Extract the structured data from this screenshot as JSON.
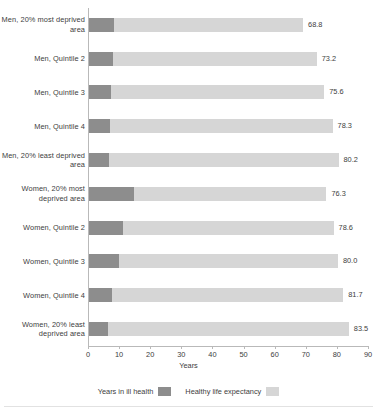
{
  "chart_data": {
    "type": "bar",
    "orientation": "horizontal",
    "stacked": true,
    "title": "",
    "xlabel": "Years",
    "ylabel": "",
    "xlim": [
      0,
      90
    ],
    "xticks": [
      0,
      10,
      20,
      30,
      40,
      50,
      60,
      70,
      80,
      90
    ],
    "xtick_labels": [
      "0",
      "10",
      "20",
      "30",
      "40",
      "50",
      "60",
      "70",
      "80",
      "90"
    ],
    "grid": false,
    "legend_position": "bottom",
    "categories": [
      "Men, 20% most deprived area",
      "Men, Quintile 2",
      "Men, Quintile 3",
      "Men, Quintile 4",
      "Men, 20% least deprived area",
      "Women, 20% most deprived area",
      "Women, Quintile 2",
      "Women, Quintile 3",
      "Women, Quintile 4",
      "Women, 20% least deprived area"
    ],
    "series": [
      {
        "name": "Years in ill health",
        "color": "#8d8d8d",
        "values": [
          8.0,
          7.6,
          7.2,
          6.6,
          6.4,
          14.4,
          11.0,
          9.8,
          7.4,
          6.2
        ]
      },
      {
        "name": "Healthy life expectancy",
        "color": "#d6d6d6",
        "values": [
          60.8,
          65.6,
          68.4,
          71.7,
          73.8,
          61.9,
          67.6,
          70.2,
          74.3,
          77.3
        ]
      }
    ],
    "totals": [
      68.8,
      73.2,
      75.6,
      78.3,
      80.2,
      76.3,
      78.6,
      80.0,
      81.7,
      83.5
    ],
    "total_labels": [
      "68.8",
      "73.2",
      "75.6",
      "78.3",
      "80.2",
      "76.3",
      "78.6",
      "80.0",
      "81.7",
      "83.5"
    ]
  },
  "legend": {
    "items": [
      {
        "label": "Years in ill health",
        "swatch": "ill"
      },
      {
        "label": "Healthy life expectancy",
        "swatch": "healthy"
      }
    ]
  },
  "colors": {
    "ill_health": "#8d8d8d",
    "healthy": "#d6d6d6",
    "axis": "#b9b9b9",
    "text": "#3d3d3d",
    "background": "#ffffff"
  }
}
